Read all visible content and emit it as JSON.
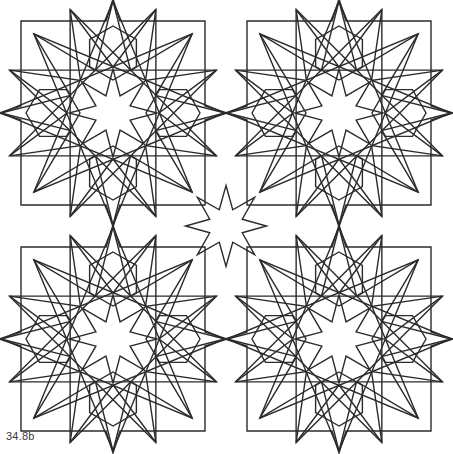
{
  "figure": {
    "caption": "34.8b",
    "width": 453,
    "height": 454,
    "background_color": "#ffffff",
    "stroke_color": "#2b2b2b",
    "stroke_width": 1.4,
    "fill": "none"
  },
  "pattern": {
    "type": "line-drawing",
    "description": "Two-by-two repeat of an eight-pointed-star rosette tile with a square frame and two superimposed large octagram polygons.",
    "tile_size": 226,
    "tile_origins": [
      {
        "name": "tile-top-left",
        "x": 0,
        "y": 0
      },
      {
        "name": "tile-top-right",
        "x": 226,
        "y": 0
      },
      {
        "name": "tile-bottom-left",
        "x": 0,
        "y": 226
      },
      {
        "name": "tile-bottom-right",
        "x": 226,
        "y": 226
      }
    ],
    "motifs": [
      {
        "name": "square-frame",
        "inset": 21,
        "sides": 4
      },
      {
        "name": "central-eight-point-star",
        "points": 8,
        "outer_radius": 42,
        "inner_radius": 17
      },
      {
        "name": "hexagonal-petal",
        "count": 4,
        "sides": 6
      },
      {
        "name": "edge-star-point",
        "count": 4
      },
      {
        "name": "large-octagram-overlay",
        "count": 2,
        "points": 8,
        "rotation_offset_deg": 22.5
      }
    ],
    "geometry": {
      "half": 113,
      "frame_inset": 21,
      "star_outer_r": 44,
      "star_inner_r": 18.5,
      "petal_center_r": 60,
      "petal_r": 27,
      "spike_half_width": 7,
      "spike_height": 22,
      "octagram_outer_r": 112,
      "octagram_inner_r": 46
    }
  }
}
